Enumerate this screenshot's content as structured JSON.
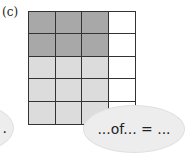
{
  "label": "(c)",
  "grid": {
    "rows": 5,
    "cols": 4,
    "colors": {
      "dark": "#a8a8a8",
      "light": "#dcdcdc",
      "empty": "#ffffff"
    },
    "cells": [
      [
        "dark",
        "dark",
        "dark",
        "empty"
      ],
      [
        "dark",
        "dark",
        "dark",
        "empty"
      ],
      [
        "light",
        "light",
        "light",
        "empty"
      ],
      [
        "light",
        "light",
        "light",
        "empty"
      ],
      [
        "light",
        "light",
        "light",
        "empty"
      ]
    ]
  },
  "bubbles": {
    "left_text": ".",
    "right_text": "...of... = ..."
  }
}
